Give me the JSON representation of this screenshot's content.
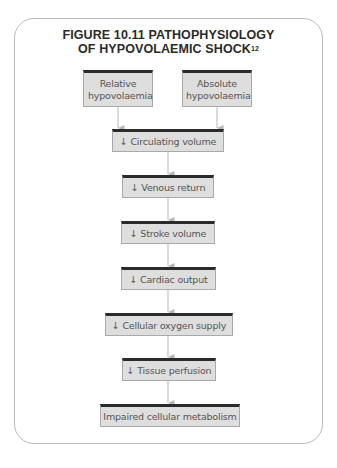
{
  "figure": {
    "title_line1": "FIGURE 10.11 PATHOPHYSIOLOGY",
    "title_line2": "OF HYPOVOLAEMIC SHOCK",
    "title_ref": "12"
  },
  "nodes": [
    {
      "id": "relative",
      "label": "Relative hypovolaemia"
    },
    {
      "id": "absolute",
      "label": "Absolute hypovolaemia"
    },
    {
      "id": "circulating",
      "label": "↓ Circulating volume"
    },
    {
      "id": "venous",
      "label": "↓ Venous return"
    },
    {
      "id": "stroke",
      "label": "↓ Stroke volume"
    },
    {
      "id": "cardiac",
      "label": "↓ Cardiac output"
    },
    {
      "id": "oxygen",
      "label": "↓ Cellular oxygen supply"
    },
    {
      "id": "tissue",
      "label": "↓ Tissue perfusion"
    },
    {
      "id": "impaired",
      "label": "Impaired cellular metabolism"
    }
  ],
  "edges": [
    {
      "from": "relative",
      "to": "circulating"
    },
    {
      "from": "absolute",
      "to": "circulating"
    },
    {
      "from": "circulating",
      "to": "venous"
    },
    {
      "from": "venous",
      "to": "stroke"
    },
    {
      "from": "stroke",
      "to": "cardiac"
    },
    {
      "from": "cardiac",
      "to": "oxygen"
    },
    {
      "from": "oxygen",
      "to": "tissue"
    },
    {
      "from": "tissue",
      "to": "impaired"
    }
  ],
  "colors": {
    "box_fill": "#dedede",
    "box_top_border": "#2b2b2b",
    "arrow": "#b5b5b5",
    "frame": "#b9b9b9"
  }
}
